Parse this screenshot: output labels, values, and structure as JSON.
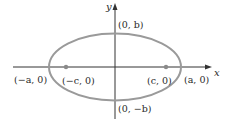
{
  "diagram": {
    "type": "ellipse-with-foci",
    "axes": {
      "x_label": "x",
      "y_label": "y"
    },
    "points": {
      "top_vertex": "(0, b)",
      "bottom_vertex": "(0, −b)",
      "left_vertex": "(−a, 0)",
      "right_vertex": "(a, 0)",
      "left_focus": "(−c, 0)",
      "right_focus": "(c, 0)"
    },
    "colors": {
      "ellipse_stroke": "#9a9a9a",
      "axis_stroke": "#333333",
      "focus_fill": "#8a8a8a",
      "text": "#2a2a2a"
    }
  }
}
